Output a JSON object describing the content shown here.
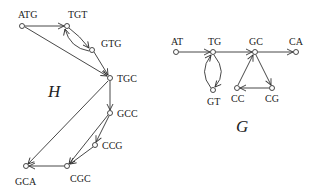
{
  "graphs": {
    "H": {
      "title": "H",
      "nodes": [
        {
          "id": "ATG",
          "label": "ATG"
        },
        {
          "id": "TGT",
          "label": "TGT"
        },
        {
          "id": "GTG",
          "label": "GTG"
        },
        {
          "id": "TGC",
          "label": "TGC"
        },
        {
          "id": "GCC",
          "label": "GCC"
        },
        {
          "id": "CCG",
          "label": "CCG"
        },
        {
          "id": "CGC",
          "label": "CGC"
        },
        {
          "id": "GCA",
          "label": "GCA"
        }
      ],
      "edges": [
        [
          "ATG",
          "TGT"
        ],
        [
          "ATG",
          "TGC"
        ],
        [
          "TGT",
          "GTG"
        ],
        [
          "GTG",
          "TGT"
        ],
        [
          "GTG",
          "TGC"
        ],
        [
          "TGC",
          "GCC"
        ],
        [
          "TGC",
          "GCA"
        ],
        [
          "GCC",
          "CCG"
        ],
        [
          "GCC",
          "CGC"
        ],
        [
          "CCG",
          "CGC"
        ],
        [
          "CGC",
          "GCA"
        ]
      ]
    },
    "G": {
      "title": "G",
      "nodes": [
        {
          "id": "AT",
          "label": "AT"
        },
        {
          "id": "TG",
          "label": "TG"
        },
        {
          "id": "GC",
          "label": "GC"
        },
        {
          "id": "CA",
          "label": "CA"
        },
        {
          "id": "GT",
          "label": "GT"
        },
        {
          "id": "CC",
          "label": "CC"
        },
        {
          "id": "CG",
          "label": "CG"
        }
      ],
      "edges": [
        [
          "AT",
          "TG"
        ],
        [
          "TG",
          "GC"
        ],
        [
          "GC",
          "CA"
        ],
        [
          "TG",
          "GT"
        ],
        [
          "GT",
          "TG"
        ],
        [
          "GC",
          "CG"
        ],
        [
          "CG",
          "CC"
        ],
        [
          "CC",
          "GC"
        ]
      ]
    }
  }
}
